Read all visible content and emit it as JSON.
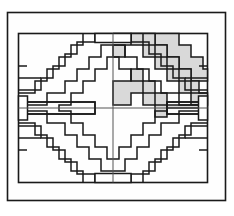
{
  "figure": {
    "width": 234,
    "height": 216,
    "colors": {
      "background": "#ffffff",
      "paper": "#fefefe",
      "stroke": "#1a1a1a",
      "frame_stroke": "#1a1a1a",
      "shade_fill": "#d9d9d9",
      "shade_stroke": "#1a1a1a",
      "unshaded_fill": "#ffffff"
    },
    "geometry": {
      "outer_frame": {
        "x": 7,
        "y": 12,
        "width": 219,
        "height": 189,
        "stroke_width": 1.6
      },
      "inner_panel": {
        "x": 18,
        "y": 33,
        "width": 190,
        "height": 150,
        "stroke_width": 1.6
      },
      "center_x": 113,
      "center_y": 108,
      "cell": 11.875,
      "columns": 16,
      "rows": 12,
      "stroke_width": 1.5,
      "axis_stroke_width": 1.0
    },
    "symmetry": {
      "horizontal_mirror": true,
      "vertical_mirror": true,
      "quadrants": [
        "top-left",
        "top-right",
        "bottom-left",
        "bottom-right"
      ]
    },
    "notches": [
      {
        "name": "top-center-notch",
        "x": 95,
        "y": 33,
        "width": 36,
        "height": 9
      },
      {
        "name": "bottom-center-notch",
        "x": 95,
        "y": 174,
        "width": 36,
        "height": 9
      },
      {
        "name": "left-center-notch",
        "x": 18,
        "y": 96,
        "width": 9,
        "height": 24
      },
      {
        "name": "right-center-notch",
        "x": 199,
        "y": 96,
        "width": 9,
        "height": 24
      }
    ],
    "shaded_bands": [
      {
        "name": "top-right-upper-band",
        "quadrant": "top-right",
        "fill": "#d9d9d9"
      },
      {
        "name": "top-right-lower-band",
        "quadrant": "top-right",
        "fill": "#d9d9d9"
      },
      {
        "name": "right-middle-band",
        "quadrant": "top-right",
        "fill": "#d9d9d9"
      }
    ],
    "band_counts": {
      "per_quadrant": 4,
      "total": 16,
      "shaded_total": 3
    },
    "labels": {
      "figure_label": "",
      "caption": ""
    }
  }
}
